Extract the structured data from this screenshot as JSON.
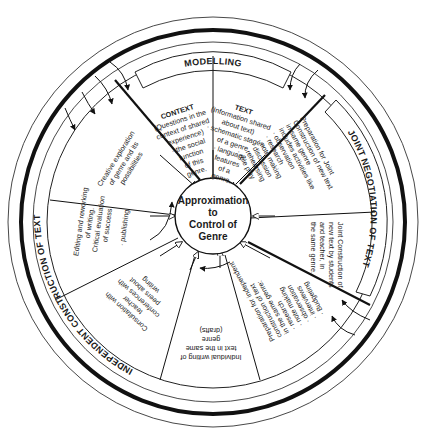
{
  "center": {
    "lines": [
      "Approximation",
      "to",
      "Control of",
      "Genre"
    ]
  },
  "stages": {
    "modelling": "MODELLING",
    "joint": "JOINT NEGOTIATION OF TEXT",
    "independent": "INDEPENDENT CONSTRUCTION OF TEXT"
  },
  "segments": {
    "context": [
      "CONTEXT",
      "(Questions in the",
      "context of shared",
      "experience)",
      "· the social",
      "function",
      "of this",
      "genre."
    ],
    "text": [
      "TEXT",
      "(Information shared",
      "about text)",
      "· schematic stages",
      "of a genre",
      "· language",
      "features",
      "of a",
      "genre."
    ],
    "prep_joint": [
      "Preparation for Joint",
      "Construction of new text",
      "in same genre",
      "includes activities like",
      "· observation",
      "· research",
      "· note making",
      "· discussion",
      "· rehearsing",
      "· role play"
    ],
    "joint_construction": [
      "Joint Construction of",
      "new text by students",
      "and teacher, in",
      "the same genre."
    ],
    "prep_independent": [
      "Preparation for independent",
      "construction of text",
      "in the same genre:",
      "· research",
      "· note making",
      "· observation",
      "· interviews",
      "· Budgeting"
    ],
    "individual_writing": [
      "Individual writing of",
      "text in the same",
      "genre",
      "(drafts)"
    ],
    "consultation": [
      "Consultation with",
      "teacher",
      "conferences with",
      "peers about",
      "writing"
    ],
    "editing": [
      "Editing and reworking",
      "of writing.",
      "Critical evaluation",
      "of success",
      "· publishing"
    ],
    "creative": [
      "Creative exploration",
      "of genre and its",
      "possibilities"
    ]
  }
}
